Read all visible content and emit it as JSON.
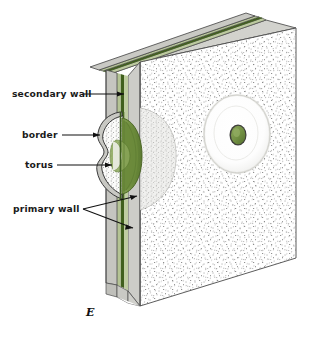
{
  "figure": {
    "letter": "E"
  },
  "labels": [
    {
      "id": "secondary-wall",
      "text": "secondary wall",
      "x": 12,
      "y": 97
    },
    {
      "id": "border",
      "text": "border",
      "x": 22,
      "y": 138
    },
    {
      "id": "torus",
      "text": "torus",
      "x": 25,
      "y": 168
    },
    {
      "id": "primary-wall",
      "text": "primary wall",
      "x": 13,
      "y": 212
    }
  ],
  "colors": {
    "dark_green_line": "#3d5c1e",
    "mid_green": "#6e8c3f",
    "torus_green": "#7a9648",
    "pale_green": "#b9c89a",
    "wall_gray": "#c9c9c4",
    "edge_gray": "#b0b0ab",
    "stipple_dot": "#6d6d6d",
    "outline": "#4a4a4a",
    "label_text": "#1a1a1a",
    "background": "#ffffff"
  },
  "structures": [
    {
      "id": "secondary-wall-layer",
      "name": "secondary wall"
    },
    {
      "id": "primary-wall-layer",
      "name": "primary wall"
    },
    {
      "id": "pit-border-chamber",
      "name": "border"
    },
    {
      "id": "pit-torus",
      "name": "torus"
    },
    {
      "id": "face-pit-aperture",
      "name": "pit aperture on block face"
    }
  ]
}
